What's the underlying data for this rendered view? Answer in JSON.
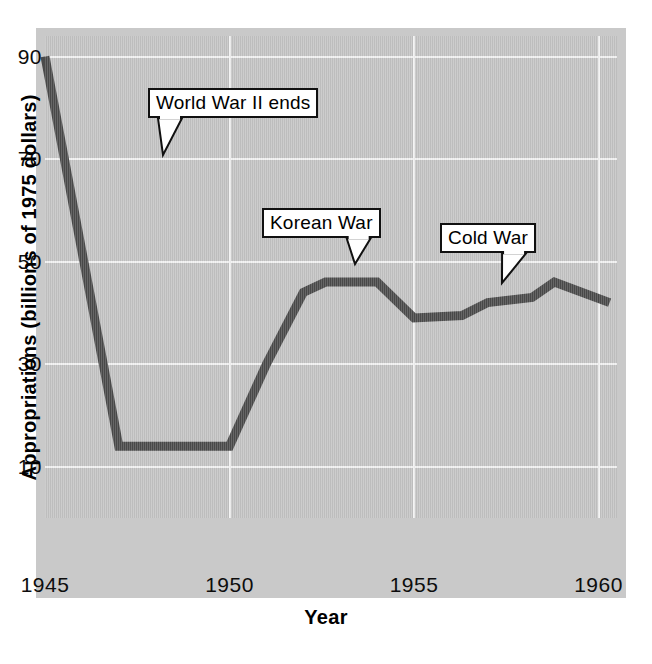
{
  "chart_data": {
    "type": "line",
    "title": "",
    "xlabel": "Year",
    "ylabel": "Appropriations (billions of 1975 dollars)",
    "xlim": [
      1945,
      1960.5
    ],
    "ylim": [
      0,
      94
    ],
    "grid": true,
    "legend": "none",
    "xticks": [
      "1945",
      "1950",
      "1955",
      "1960"
    ],
    "xtick_values": [
      1945,
      1950,
      1955,
      1960
    ],
    "yticks": [
      "10",
      "30",
      "50",
      "70",
      "90"
    ],
    "ytick_values": [
      10,
      30,
      50,
      70,
      90
    ],
    "series": [
      {
        "name": "Appropriations",
        "color": "#4a4a4a",
        "x": [
          1945,
          1947,
          1950,
          1951,
          1952,
          1952.6,
          1954,
          1955,
          1956.3,
          1957,
          1958.2,
          1958.8,
          1960.3
        ],
        "values": [
          90,
          14,
          14,
          30,
          44,
          46,
          46,
          39,
          39.5,
          42,
          43,
          46,
          42
        ]
      }
    ],
    "annotations": [
      {
        "label": "World War II ends",
        "box_x": 148,
        "box_y": 88,
        "point_x": 163,
        "point_y": 155
      },
      {
        "label": "Korean War",
        "box_x": 262,
        "box_y": 208,
        "point_x": 355,
        "point_y": 264
      },
      {
        "label": "Cold War",
        "box_x": 440,
        "box_y": 223,
        "point_x": 502,
        "point_y": 283
      }
    ]
  },
  "colors": {
    "panel": "#c3c3c3",
    "gridline": "#f2f2f2",
    "line": "#4a4a4a",
    "text": "#000000"
  }
}
